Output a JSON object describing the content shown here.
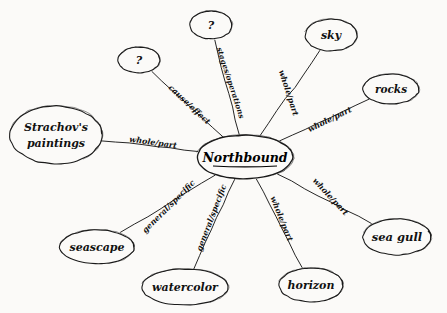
{
  "diagram": {
    "title_node": {
      "label": "Northbound",
      "underlined": true,
      "cx": 245,
      "cy": 157,
      "rx": 48,
      "ry": 22,
      "font_size": 12.5
    },
    "ink_color": "#1a1a1a",
    "background_color": "#fbfaf8",
    "nodes": [
      {
        "id": "question-left",
        "label": "?",
        "cx": 139,
        "cy": 60,
        "rx": 21,
        "ry": 13,
        "font_size": 11,
        "edge_label": "cause/effect",
        "edge_label_x": 189,
        "edge_label_y": 105,
        "edge_label_rotation": 43,
        "edge_font_size": 8
      },
      {
        "id": "question-top",
        "label": "?",
        "cx": 211,
        "cy": 25,
        "rx": 21,
        "ry": 14,
        "font_size": 11,
        "edge_label": "stages/operations",
        "edge_label_x": 230,
        "edge_label_y": 83,
        "edge_label_rotation": 72,
        "edge_font_size": 7.5
      },
      {
        "id": "sky",
        "label": "sky",
        "cx": 331,
        "cy": 35,
        "rx": 26,
        "ry": 16,
        "font_size": 11,
        "edge_label": "whole/part",
        "edge_label_x": 288,
        "edge_label_y": 93,
        "edge_label_rotation": 72,
        "edge_font_size": 8
      },
      {
        "id": "rocks",
        "label": "rocks",
        "cx": 391,
        "cy": 89,
        "rx": 28,
        "ry": 15,
        "font_size": 10.5,
        "edge_label": "whole/part",
        "edge_label_x": 330,
        "edge_label_y": 120,
        "edge_label_rotation": -26,
        "edge_font_size": 8
      },
      {
        "id": "sea-gull",
        "label": "sea gull",
        "cx": 397,
        "cy": 237,
        "rx": 34,
        "ry": 18,
        "font_size": 11.5,
        "edge_label": "whole/part",
        "edge_label_x": 330,
        "edge_label_y": 197,
        "edge_label_rotation": 47,
        "edge_font_size": 8
      },
      {
        "id": "horizon",
        "label": "horizon",
        "cx": 311,
        "cy": 285,
        "rx": 32,
        "ry": 17,
        "font_size": 11,
        "edge_label": "whole/part",
        "edge_label_x": 281,
        "edge_label_y": 219,
        "edge_label_rotation": 68,
        "edge_font_size": 8
      },
      {
        "id": "watercolor",
        "label": "watercolor",
        "cx": 185,
        "cy": 287,
        "rx": 43,
        "ry": 18,
        "font_size": 11,
        "edge_label": "general/specific",
        "edge_label_x": 212,
        "edge_label_y": 218,
        "edge_label_rotation": -69,
        "edge_font_size": 8
      },
      {
        "id": "seascape",
        "label": "seascape",
        "cx": 97,
        "cy": 247,
        "rx": 37,
        "ry": 17,
        "font_size": 11,
        "edge_label": "general/specific",
        "edge_label_x": 169,
        "edge_label_y": 207,
        "edge_label_rotation": -45,
        "edge_font_size": 8
      },
      {
        "id": "strachovs-paintings",
        "label": "Strachov's",
        "label_line2": "paintings",
        "cx": 56,
        "cy": 135,
        "rx": 46,
        "ry": 29,
        "font_size": 11,
        "edge_label": "whole/part",
        "edge_label_x": 153,
        "edge_label_y": 143,
        "edge_label_rotation": 8,
        "edge_font_size": 8
      }
    ]
  }
}
